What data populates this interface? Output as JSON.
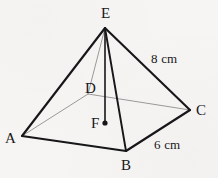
{
  "figure": {
    "kind": "square-pyramid-net-diagram",
    "background_color": "#f6f5f3",
    "canvas": {
      "width": 218,
      "height": 178
    },
    "stroke_colors": {
      "visible_edge": "#17171a",
      "hidden_edge": "#9a9a9a",
      "height_line": "#17171a"
    }
  },
  "vertices": [
    {
      "id": "E",
      "label": "E",
      "role": "apex",
      "x": 105,
      "y": 28,
      "label_x": 101,
      "label_y": 6
    },
    {
      "id": "A",
      "label": "A",
      "role": "base-front-left",
      "x": 22,
      "y": 136,
      "label_x": 5,
      "label_y": 131
    },
    {
      "id": "B",
      "label": "B",
      "role": "base-front-right",
      "x": 126,
      "y": 151,
      "label_x": 121,
      "label_y": 158
    },
    {
      "id": "C",
      "label": "C",
      "role": "base-right",
      "x": 190,
      "y": 110,
      "label_x": 196,
      "label_y": 103
    },
    {
      "id": "D",
      "label": "D",
      "role": "base-back-hidden",
      "x": 88,
      "y": 94,
      "label_x": 85,
      "label_y": 81
    },
    {
      "id": "F",
      "label": "F",
      "role": "base-center",
      "x": 105,
      "y": 123,
      "label_x": 91,
      "label_y": 116
    }
  ],
  "edges": [
    {
      "id": "EA",
      "from": "E",
      "to": "A",
      "style": "visible",
      "width": 2.1
    },
    {
      "id": "EB",
      "from": "E",
      "to": "B",
      "style": "visible",
      "width": 1.9
    },
    {
      "id": "EC",
      "from": "E",
      "to": "C",
      "style": "visible",
      "width": 2.1
    },
    {
      "id": "AB",
      "from": "A",
      "to": "B",
      "style": "visible",
      "width": 2.1
    },
    {
      "id": "BC",
      "from": "B",
      "to": "C",
      "style": "visible",
      "width": 2.1
    },
    {
      "id": "AD",
      "from": "A",
      "to": "D",
      "style": "hidden",
      "width": 1.0
    },
    {
      "id": "DC",
      "from": "D",
      "to": "C",
      "style": "hidden",
      "width": 1.0
    },
    {
      "id": "ED",
      "from": "E",
      "to": "D",
      "style": "hidden",
      "width": 1.0
    },
    {
      "id": "EF",
      "from": "E",
      "to": "F",
      "style": "height",
      "width": 1.6
    }
  ],
  "center_dot": {
    "x": 105,
    "y": 123,
    "radius": 2.6
  },
  "measurements": [
    {
      "id": "slant-edge",
      "value": "8",
      "unit": "cm",
      "text": "8 cm",
      "applies_to_edge": "EC",
      "label_x": 151,
      "label_y": 52
    },
    {
      "id": "base-edge",
      "value": "6",
      "unit": "cm",
      "text": "6 cm",
      "applies_to_edge": "BC",
      "label_x": 154,
      "label_y": 138
    }
  ]
}
